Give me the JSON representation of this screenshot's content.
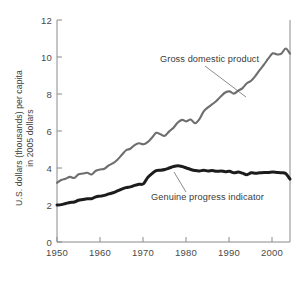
{
  "chart_data": {
    "type": "line",
    "title": "",
    "xlabel": "",
    "ylabel": "U.S. dollars (thousands) per capita in 2005 dollars",
    "ylabel_line1": "U.S. dollars (thousands) per capita",
    "ylabel_line2": "in 2005 dollars",
    "xlim": [
      1950,
      2004
    ],
    "ylim": [
      0,
      12
    ],
    "grid": false,
    "legend_position": "inline-annotations",
    "xticks": [
      1950,
      1960,
      1970,
      1980,
      1990,
      2000
    ],
    "xtick_labels": [
      "1950",
      "1960",
      "1970",
      "1980",
      "1990",
      "2000"
    ],
    "yticks": [
      0,
      2,
      4,
      6,
      8,
      10,
      12
    ],
    "ytick_labels": [
      "0",
      "2",
      "4",
      "6",
      "8",
      "10",
      "12"
    ],
    "series": [
      {
        "name": "Gross domestic product",
        "color": "#6e6e6e",
        "width": 2.1,
        "x": [
          1950,
          1951,
          1952,
          1953,
          1954,
          1955,
          1956,
          1957,
          1958,
          1959,
          1960,
          1961,
          1962,
          1963,
          1964,
          1965,
          1966,
          1967,
          1968,
          1969,
          1970,
          1971,
          1972,
          1973,
          1974,
          1975,
          1976,
          1977,
          1978,
          1979,
          1980,
          1981,
          1982,
          1983,
          1984,
          1985,
          1986,
          1987,
          1988,
          1989,
          1990,
          1991,
          1992,
          1993,
          1994,
          1995,
          1996,
          1997,
          1998,
          1999,
          2000,
          2001,
          2002,
          2003,
          2004
        ],
        "values": [
          3.2,
          3.35,
          3.42,
          3.52,
          3.46,
          3.66,
          3.7,
          3.74,
          3.65,
          3.85,
          3.92,
          3.96,
          4.14,
          4.26,
          4.45,
          4.7,
          4.96,
          5.04,
          5.24,
          5.34,
          5.28,
          5.4,
          5.64,
          5.9,
          5.82,
          5.74,
          5.98,
          6.18,
          6.46,
          6.6,
          6.52,
          6.62,
          6.42,
          6.64,
          7.06,
          7.28,
          7.45,
          7.64,
          7.88,
          8.08,
          8.14,
          8.02,
          8.18,
          8.32,
          8.58,
          8.72,
          8.98,
          9.3,
          9.6,
          9.92,
          10.2,
          10.14,
          10.18,
          10.46,
          10.18
        ]
      },
      {
        "name": "Genuine progress indicator",
        "color": "#1c1c1c",
        "width": 3.0,
        "x": [
          1950,
          1951,
          1952,
          1953,
          1954,
          1955,
          1956,
          1957,
          1958,
          1959,
          1960,
          1961,
          1962,
          1963,
          1964,
          1965,
          1966,
          1967,
          1968,
          1969,
          1970,
          1971,
          1972,
          1973,
          1974,
          1975,
          1976,
          1977,
          1978,
          1979,
          1980,
          1981,
          1982,
          1983,
          1984,
          1985,
          1986,
          1987,
          1988,
          1989,
          1990,
          1991,
          1992,
          1993,
          1994,
          1995,
          1996,
          1997,
          1998,
          1999,
          2000,
          2001,
          2002,
          2003,
          2004
        ],
        "values": [
          2.0,
          2.02,
          2.08,
          2.14,
          2.16,
          2.26,
          2.3,
          2.34,
          2.34,
          2.44,
          2.48,
          2.52,
          2.6,
          2.66,
          2.76,
          2.86,
          2.94,
          2.98,
          3.06,
          3.12,
          3.14,
          3.48,
          3.7,
          3.86,
          3.88,
          3.92,
          4.0,
          4.08,
          4.12,
          4.08,
          4.0,
          3.92,
          3.86,
          3.84,
          3.88,
          3.84,
          3.86,
          3.82,
          3.84,
          3.8,
          3.82,
          3.74,
          3.78,
          3.72,
          3.64,
          3.74,
          3.72,
          3.74,
          3.76,
          3.76,
          3.78,
          3.76,
          3.74,
          3.7,
          3.4
        ]
      }
    ],
    "annotations": [
      {
        "label": "Gross domestic product",
        "series": "Gross domestic product",
        "text_x": 160,
        "text_y": 62,
        "leader_from_x": 205,
        "leader_from_y": 66,
        "leader_to_x": 246,
        "leader_to_y": 97
      },
      {
        "label": "Genuine progress indicator",
        "series": "Genuine progress indicator",
        "text_x": 151,
        "text_y": 200,
        "leader_from_x": 186,
        "leader_from_y": 192,
        "leader_to_x": 174,
        "leader_to_y": 172
      }
    ]
  },
  "axes": {
    "plot_left": 57,
    "plot_right": 290,
    "plot_top": 20,
    "plot_bottom": 242
  }
}
